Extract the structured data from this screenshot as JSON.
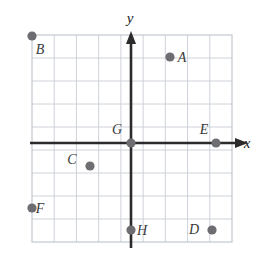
{
  "figure": {
    "kind": "coordinate-plane-with-labeled-points",
    "width": 264,
    "height": 262,
    "background_color": "#ffffff"
  },
  "grid": {
    "left": 32,
    "top": 35,
    "right": 232,
    "bottom": 242,
    "cell_size": 22.2,
    "columns": 9,
    "rows": 9,
    "line_color": "#c9cdd6",
    "border_color": "#bcc1cb",
    "show_grid": true
  },
  "axes": {
    "origin_x": 131,
    "origin_y": 143,
    "color": "#2b2b2b",
    "stroke_width": 2.6,
    "x_axis": {
      "label": "x",
      "label_x": 247,
      "label_y": 148,
      "start_x": 30,
      "end_x": 247,
      "arrow": "right"
    },
    "y_axis": {
      "label": "y",
      "label_x": 130,
      "label_y": 23,
      "start_y": 248,
      "end_y": 32,
      "arrow": "up"
    }
  },
  "points": {
    "color": "#6e6e72",
    "radius": 4.6,
    "items": [
      {
        "label": "A",
        "x": 170,
        "y": 57,
        "label_x": 182,
        "label_y": 62,
        "grid_x": 2,
        "grid_y": 4
      },
      {
        "label": "B",
        "x": 32,
        "y": 36,
        "label_x": 40,
        "label_y": 54,
        "grid_x": -4,
        "grid_y": 5
      },
      {
        "label": "C",
        "x": 90,
        "y": 166,
        "label_x": 72,
        "label_y": 164,
        "grid_x": -2,
        "grid_y": -1
      },
      {
        "label": "D",
        "x": 212,
        "y": 230,
        "label_x": 194,
        "label_y": 234,
        "grid_x": 4,
        "grid_y": -4
      },
      {
        "label": "E",
        "x": 216,
        "y": 143,
        "label_x": 204,
        "label_y": 134,
        "grid_x": 4,
        "grid_y": 0
      },
      {
        "label": "F",
        "x": 32,
        "y": 208,
        "label_x": 40,
        "label_y": 213,
        "grid_x": -4,
        "grid_y": -3
      },
      {
        "label": "G",
        "x": 131,
        "y": 143,
        "label_x": 117,
        "label_y": 134,
        "grid_x": 0,
        "grid_y": 0
      },
      {
        "label": "H",
        "x": 131,
        "y": 230,
        "label_x": 142,
        "label_y": 235,
        "grid_x": 0,
        "grid_y": -4
      }
    ]
  }
}
